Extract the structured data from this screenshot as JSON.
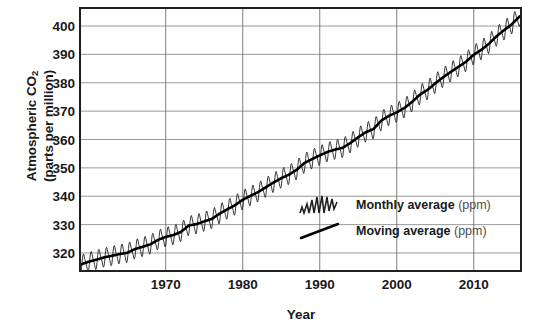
{
  "chart_data": {
    "type": "line",
    "title": "",
    "xlabel": "Year",
    "ylabel_line1": "Atmospheric CO",
    "ylabel_sub": "2",
    "ylabel_line2": "(parts per million)",
    "xlim": [
      1959,
      2016
    ],
    "ylim": [
      314,
      406
    ],
    "xticks": [
      1970,
      1980,
      1990,
      2000,
      2010
    ],
    "yticks": [
      320,
      330,
      340,
      350,
      360,
      370,
      380,
      390,
      400
    ],
    "grid": "both",
    "legend_position": "inside-center-right",
    "series": [
      {
        "name": "Monthly average (ppm)",
        "label_strong": "Monthly average",
        "label_unit": "(ppm)",
        "style": "oscillating-thin",
        "color": "#231f20",
        "seasonal_amplitude_ppm": 3.1
      },
      {
        "name": "Moving average (ppm)",
        "label_strong": "Moving average",
        "label_unit": "(ppm)",
        "style": "thick-smooth",
        "color": "#000000"
      }
    ],
    "x": [
      1959,
      1960,
      1961,
      1962,
      1963,
      1964,
      1965,
      1966,
      1967,
      1968,
      1969,
      1970,
      1971,
      1972,
      1973,
      1974,
      1975,
      1976,
      1977,
      1978,
      1979,
      1980,
      1981,
      1982,
      1983,
      1984,
      1985,
      1986,
      1987,
      1988,
      1989,
      1990,
      1991,
      1992,
      1993,
      1994,
      1995,
      1996,
      1997,
      1998,
      1999,
      2000,
      2001,
      2002,
      2003,
      2004,
      2005,
      2006,
      2007,
      2008,
      2009,
      2010,
      2011,
      2012,
      2013,
      2014,
      2015,
      2016
    ],
    "moving_average_values": [
      315.98,
      316.91,
      317.64,
      318.45,
      318.99,
      319.62,
      320.04,
      321.37,
      322.18,
      323.05,
      324.62,
      325.68,
      326.32,
      327.46,
      329.68,
      330.19,
      331.12,
      332.03,
      333.84,
      335.41,
      336.84,
      338.76,
      340.12,
      341.48,
      343.15,
      344.85,
      346.35,
      347.61,
      349.31,
      351.69,
      353.1,
      354.39,
      355.61,
      356.45,
      357.1,
      358.83,
      360.82,
      362.61,
      363.73,
      366.7,
      368.38,
      369.55,
      371.14,
      373.28,
      375.8,
      377.52,
      379.8,
      381.9,
      383.79,
      385.6,
      387.43,
      389.9,
      391.65,
      393.85,
      396.52,
      398.65,
      400.83,
      403.5
    ]
  }
}
